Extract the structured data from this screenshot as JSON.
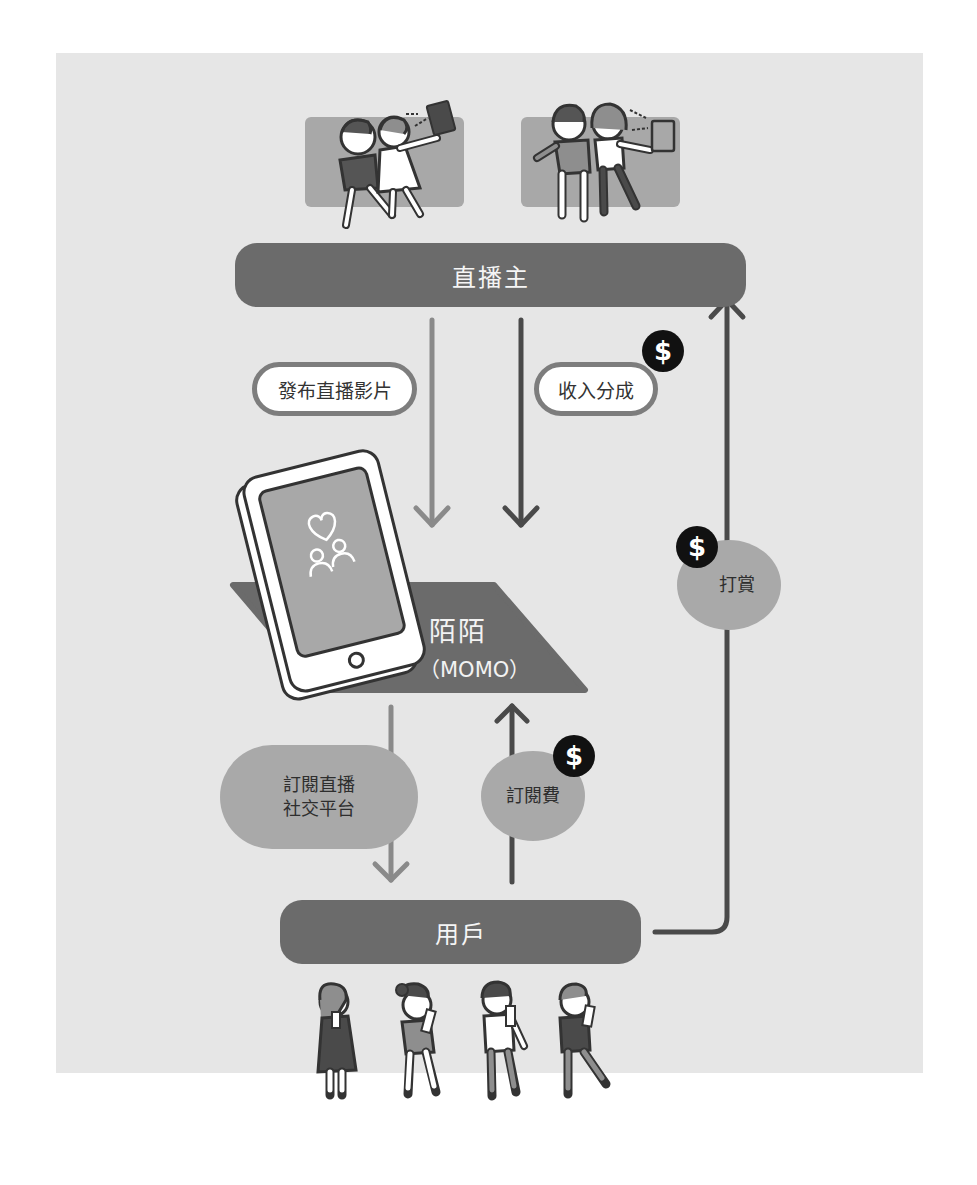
{
  "diagram": {
    "type": "business-model-flow",
    "nodes": {
      "streamers": {
        "label": "直播主"
      },
      "platform": {
        "label_cn": "陌陌",
        "label_en": "（MOMO）"
      },
      "users": {
        "label": "用戶"
      }
    },
    "flows": [
      {
        "id": "publish",
        "label": "發布直播影片",
        "from": "streamers",
        "to": "platform",
        "money": false
      },
      {
        "id": "revenue_share",
        "label": "收入分成",
        "from": "platform",
        "to": "streamers",
        "money": true
      },
      {
        "id": "subscribe_service",
        "label_line1": "訂閱直播",
        "label_line2": "社交平台",
        "from": "platform",
        "to": "users",
        "money": false
      },
      {
        "id": "subscription_fee",
        "label": "訂閱費",
        "from": "users",
        "to": "platform",
        "money": true
      },
      {
        "id": "tipping",
        "label": "打賞",
        "from": "users",
        "to": "streamers",
        "money": true
      }
    ],
    "money_symbol": "$",
    "colors": {
      "panel_bg": "#e6e6e6",
      "bar_fill": "#6b6b6b",
      "blob_fill": "#a9a9a9",
      "arrow_light": "#8a8a8a",
      "arrow_dark": "#4a4a4a",
      "coin_fill": "#111111"
    }
  }
}
